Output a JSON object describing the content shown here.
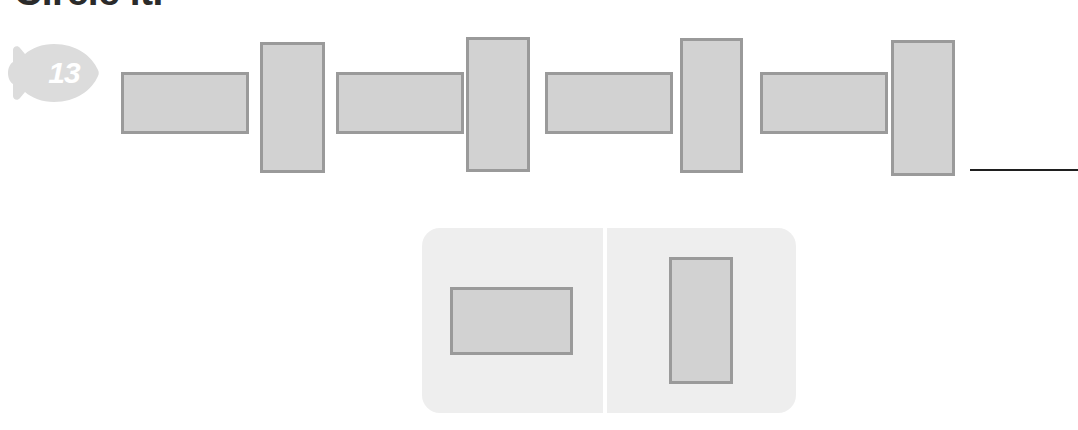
{
  "worksheet": {
    "heading": "Circle it.",
    "problem_number": "13",
    "badge_icon": "fish-icon",
    "badge_fill_color": "#dcdcdc",
    "shape_fill_color": "#d2d2d2",
    "shape_border_color": "#9a9a9a",
    "panel_background_color": "#eeeeee",
    "answer_line_color": "#1f1f1f"
  },
  "pattern": {
    "label": "shape pattern sequence",
    "shapes": [
      {
        "orientation": "horizontal",
        "x": 121,
        "y": 72,
        "width": 128,
        "height": 62
      },
      {
        "orientation": "vertical",
        "x": 260,
        "y": 42,
        "width": 65,
        "height": 131
      },
      {
        "orientation": "horizontal",
        "x": 336,
        "y": 72,
        "width": 128,
        "height": 62
      },
      {
        "orientation": "vertical",
        "x": 466,
        "y": 37,
        "width": 64,
        "height": 135
      },
      {
        "orientation": "horizontal",
        "x": 545,
        "y": 72,
        "width": 128,
        "height": 62
      },
      {
        "orientation": "vertical",
        "x": 680,
        "y": 38,
        "width": 63,
        "height": 135
      },
      {
        "orientation": "horizontal",
        "x": 760,
        "y": 72,
        "width": 128,
        "height": 62
      },
      {
        "orientation": "vertical",
        "x": 891,
        "y": 40,
        "width": 64,
        "height": 136
      }
    ]
  },
  "answer": {
    "line_label": "answer blank line"
  },
  "options": [
    {
      "id": "option-a",
      "shape": "horizontal-rectangle",
      "shape_label": "wide rectangle"
    },
    {
      "id": "option-b",
      "shape": "vertical-rectangle",
      "shape_label": "tall rectangle"
    }
  ]
}
